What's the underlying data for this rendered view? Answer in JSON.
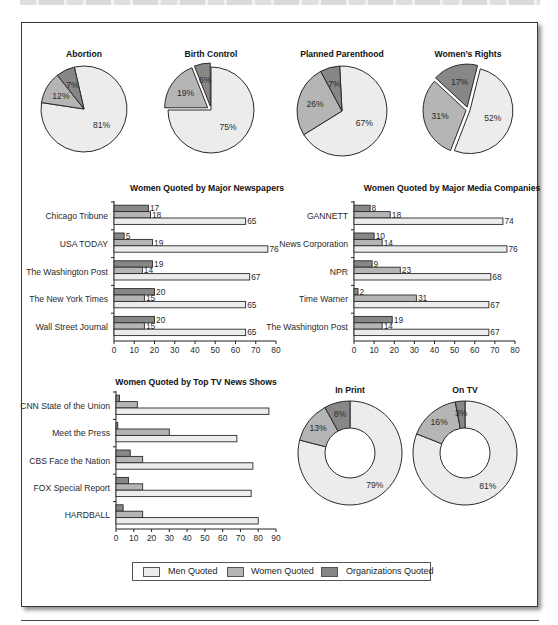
{
  "legend": {
    "items": [
      {
        "key": "men",
        "label": "Men Quoted",
        "color": "#ececec"
      },
      {
        "key": "women",
        "label": "Women Quoted",
        "color": "#b5b5b5"
      },
      {
        "key": "org",
        "label": "Organizations Quoted",
        "color": "#878787"
      }
    ]
  },
  "chart_data": [
    {
      "type": "pie",
      "title": "Abortion",
      "slices": [
        {
          "name": "Men Quoted",
          "color_key": "men",
          "value": 81,
          "label": "81%"
        },
        {
          "name": "Women Quoted",
          "color_key": "women",
          "value": 12,
          "label": "12%"
        },
        {
          "name": "Organizations Quoted",
          "color_key": "org",
          "value": 7,
          "label": "7%"
        }
      ]
    },
    {
      "type": "pie",
      "title": "Birth Control",
      "slices": [
        {
          "name": "Men Quoted",
          "color_key": "men",
          "value": 75,
          "label": "75%"
        },
        {
          "name": "Women Quoted",
          "color_key": "women",
          "value": 19,
          "label": "19%"
        },
        {
          "name": "Organizations Quoted",
          "color_key": "org",
          "value": 6,
          "label": "6%"
        }
      ]
    },
    {
      "type": "pie",
      "title": "Planned Parenthood",
      "slices": [
        {
          "name": "Men Quoted",
          "color_key": "men",
          "value": 67,
          "label": "67%"
        },
        {
          "name": "Women Quoted",
          "color_key": "women",
          "value": 26,
          "label": "26%"
        },
        {
          "name": "Organizations Quoted",
          "color_key": "org",
          "value": 7,
          "label": "7%"
        }
      ]
    },
    {
      "type": "pie",
      "title": "Women’s Rights",
      "slices": [
        {
          "name": "Men Quoted",
          "color_key": "men",
          "value": 52,
          "label": "52%"
        },
        {
          "name": "Women Quoted",
          "color_key": "women",
          "value": 31,
          "label": "31%"
        },
        {
          "name": "Organizations Quoted",
          "color_key": "org",
          "value": 17,
          "label": "17%"
        }
      ]
    },
    {
      "type": "bar",
      "orientation": "horizontal",
      "title": "Women Quoted by Major Newspapers",
      "categories": [
        "Chicago Tribune",
        "USA TODAY",
        "The Washington Post",
        "The New York Times",
        "Wall Street Journal"
      ],
      "series": [
        {
          "name": "Organizations Quoted",
          "color_key": "org",
          "values": [
            17,
            5,
            19,
            20,
            20
          ]
        },
        {
          "name": "Women Quoted",
          "color_key": "women",
          "values": [
            18,
            19,
            14,
            15,
            15
          ]
        },
        {
          "name": "Men Quoted",
          "color_key": "men",
          "values": [
            65,
            76,
            67,
            65,
            65
          ]
        }
      ],
      "xlim": [
        0,
        80
      ],
      "xticks": [
        0,
        10,
        20,
        30,
        40,
        50,
        60,
        70,
        80
      ],
      "data_labels": true
    },
    {
      "type": "bar",
      "orientation": "horizontal",
      "title": "Women Quoted by Major Media Companies",
      "categories": [
        "GANNETT",
        "News Corporation",
        "NPR",
        "Time Warner",
        "The Washington Post"
      ],
      "series": [
        {
          "name": "Organizations Quoted",
          "color_key": "org",
          "values": [
            8,
            10,
            9,
            2,
            19
          ]
        },
        {
          "name": "Women Quoted",
          "color_key": "women",
          "values": [
            18,
            14,
            23,
            31,
            14
          ]
        },
        {
          "name": "Men Quoted",
          "color_key": "men",
          "values": [
            74,
            76,
            68,
            67,
            67
          ]
        }
      ],
      "xlim": [
        0,
        80
      ],
      "xticks": [
        0,
        10,
        20,
        30,
        40,
        50,
        60,
        70,
        80
      ],
      "data_labels": true
    },
    {
      "type": "bar",
      "orientation": "horizontal",
      "title": "Women Quoted by Top TV News Shows",
      "categories": [
        "CNN State of the Union",
        "Meet the Press",
        "CBS Face the Nation",
        "FOX Special Report",
        "HARDBALL"
      ],
      "series": [
        {
          "name": "Organizations Quoted",
          "color_key": "org",
          "values": [
            2,
            1,
            8,
            7,
            4
          ]
        },
        {
          "name": "Women Quoted",
          "color_key": "women",
          "values": [
            12,
            30,
            15,
            15,
            15
          ]
        },
        {
          "name": "Men Quoted",
          "color_key": "men",
          "values": [
            86,
            68,
            77,
            76,
            80
          ]
        }
      ],
      "xlim": [
        0,
        90
      ],
      "xticks": [
        0,
        10,
        20,
        30,
        40,
        50,
        60,
        70,
        80,
        90
      ],
      "data_labels": false
    },
    {
      "type": "pie",
      "donut": true,
      "title": "In Print",
      "slices": [
        {
          "name": "Men Quoted",
          "color_key": "men",
          "value": 79,
          "label": "79%"
        },
        {
          "name": "Women Quoted",
          "color_key": "women",
          "value": 13,
          "label": "13%"
        },
        {
          "name": "Organizations Quoted",
          "color_key": "org",
          "value": 8,
          "label": "8%"
        }
      ]
    },
    {
      "type": "pie",
      "donut": true,
      "title": "On TV",
      "slices": [
        {
          "name": "Men Quoted",
          "color_key": "men",
          "value": 81,
          "label": "81%"
        },
        {
          "name": "Women Quoted",
          "color_key": "women",
          "value": 16,
          "label": "16%"
        },
        {
          "name": "Organizations Quoted",
          "color_key": "org",
          "value": 3,
          "label": "3%"
        }
      ]
    }
  ]
}
